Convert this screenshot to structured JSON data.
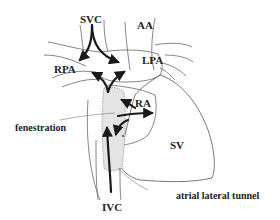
{
  "diagram": {
    "type": "anatomical-schematic",
    "labels": {
      "svc": "SVC",
      "aa": "AA",
      "rpa": "RPA",
      "lpa": "LPA",
      "ra": "RA",
      "fenestration": "fenestration",
      "sv": "SV",
      "ivc": "IVC",
      "tunnel": "atrial lateral tunnel"
    },
    "colors": {
      "outline": "#555555",
      "arrow": "#1a1a1a",
      "tunnel_fill": "#e4e4e4",
      "text": "#222222"
    }
  }
}
